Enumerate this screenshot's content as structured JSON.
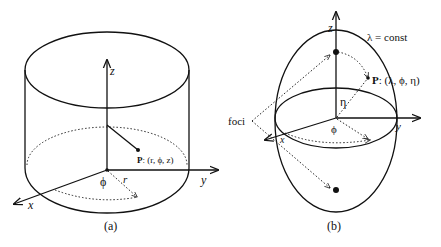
{
  "figure_a": {
    "caption": "(a)",
    "shape": "cylinder",
    "axes": {
      "x": "x",
      "y": "y",
      "z": "z"
    },
    "angle_label": "ϕ",
    "radius_label": "r",
    "point_label": "P",
    "point_coords": ": (r, ϕ, z)"
  },
  "figure_b": {
    "caption": "(b)",
    "shape": "prolate spheroid",
    "axes": {
      "x": "x",
      "y": "y",
      "z": "z"
    },
    "surface_label": "λ = const",
    "foci_label": "foci",
    "angle_phi_label": "ϕ",
    "angle_eta_label": "η",
    "point_label": "P",
    "point_coords": ": (λ, ϕ, η)"
  },
  "colors": {
    "ink": "#111111",
    "background": "#ffffff"
  }
}
